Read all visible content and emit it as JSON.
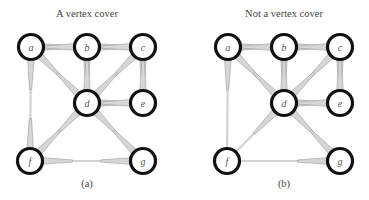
{
  "figure": {
    "panels": [
      {
        "id": "a",
        "title": "A vertex cover",
        "caption": "(a)",
        "offset_x": 0,
        "cover": [
          "a",
          "b",
          "c",
          "d",
          "e",
          "f",
          "g"
        ],
        "vertex_labels": {
          "a": "a",
          "b": "b",
          "c": "c",
          "d": "d",
          "e": "e",
          "f": "f",
          "g": "g"
        }
      },
      {
        "id": "b",
        "title": "Not a vertex cover",
        "caption": "(b)",
        "offset_x": 197,
        "cover": [
          "a",
          "b",
          "c",
          "d",
          "e",
          "g"
        ],
        "vertex_labels": {
          "a": "a",
          "b": "b",
          "c": "c",
          "d": "d",
          "e": "e",
          "f": "f",
          "g": "g"
        }
      }
    ],
    "vertices": {
      "a": [
        31,
        47
      ],
      "b": [
        87,
        47
      ],
      "c": [
        143,
        47
      ],
      "d": [
        87,
        103
      ],
      "e": [
        143,
        103
      ],
      "f": [
        30,
        161
      ],
      "g": [
        143,
        161
      ]
    },
    "edges": [
      [
        "a",
        "b"
      ],
      [
        "b",
        "c"
      ],
      [
        "a",
        "d"
      ],
      [
        "b",
        "d"
      ],
      [
        "c",
        "d"
      ],
      [
        "c",
        "e"
      ],
      [
        "d",
        "e"
      ],
      [
        "a",
        "f"
      ],
      [
        "d",
        "f"
      ],
      [
        "d",
        "g"
      ],
      [
        "f",
        "g"
      ]
    ],
    "colors": {
      "node_stroke": "#111111",
      "node_fill": "#ffffff",
      "edge_fill": "#d6d6d6",
      "edge_side": "#9a9a9a",
      "text": "#444444"
    }
  }
}
